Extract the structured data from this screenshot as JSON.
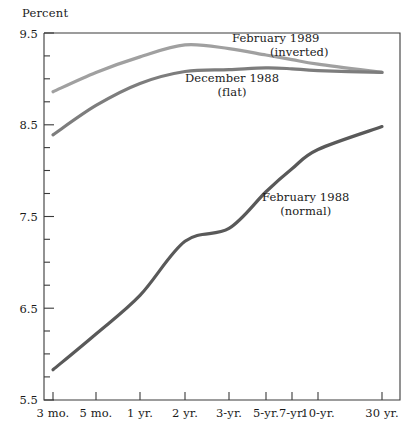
{
  "chart_data": {
    "type": "line",
    "title": "",
    "ylabel": "Percent",
    "xlabel": "",
    "ylim": [
      5.5,
      9.5
    ],
    "ytick_labels": [
      "9.5",
      "8.5",
      "7.5",
      "6.5",
      "5.5"
    ],
    "ytick_values": [
      9.5,
      8.5,
      7.5,
      6.5,
      5.5
    ],
    "yminor_step": 0.25,
    "grid": false,
    "legend_position": "inline-annotations",
    "categories": [
      "3 mo.",
      "5 mo.",
      "1 yr.",
      "2 yr.",
      "3-yr.",
      "5-yr.",
      "7-yr.",
      "10-yr.",
      "30 yr."
    ],
    "x_positions_px": [
      53,
      96,
      140,
      185,
      229,
      266,
      292,
      318,
      382
    ],
    "series": [
      {
        "name": "February 1989",
        "note": "(inverted)",
        "color": "#a0a0a0",
        "values": [
          8.86,
          9.07,
          9.24,
          9.37,
          9.33,
          9.26,
          9.21,
          9.16,
          9.07
        ]
      },
      {
        "name": "December 1988",
        "note": "(flat)",
        "color": "#7d7d7d",
        "values": [
          8.39,
          8.71,
          8.95,
          9.08,
          9.1,
          9.12,
          9.11,
          9.09,
          9.07
        ]
      },
      {
        "name": "February 1988",
        "note": "(normal)",
        "color": "#595959",
        "values": [
          5.83,
          6.22,
          6.64,
          7.23,
          7.37,
          7.77,
          8.02,
          8.23,
          8.48
        ]
      }
    ],
    "annotations": [
      {
        "label": "February 1989",
        "sub": "(inverted)",
        "x_px": 232,
        "y_px": 31
      },
      {
        "label": "December 1988",
        "sub": "(flat)",
        "x_px": 185,
        "y_px": 71
      },
      {
        "label": "February 1988",
        "sub": "(normal)",
        "x_px": 262,
        "y_px": 190
      }
    ]
  },
  "axis": {
    "frame_left_px": 44,
    "frame_right_px": 400,
    "frame_top_px": 33,
    "frame_bottom_px": 400,
    "axis_color": "#3a3a3a"
  }
}
